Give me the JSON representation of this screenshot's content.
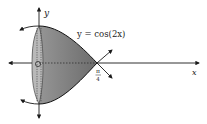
{
  "diagram": {
    "curve_label": "y = cos(2x)",
    "x_axis_label": "x",
    "y_axis_label": "y",
    "origin_label": "O",
    "tick_label_numerator": "π",
    "tick_label_denominator": "4",
    "colors": {
      "solid_fill": "#8a8a8a",
      "solid_front_face": "#b4b4b4",
      "axis": "#1a1a1a"
    }
  }
}
